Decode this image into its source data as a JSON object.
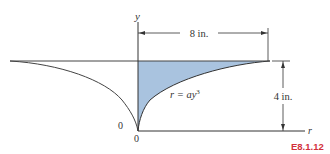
{
  "figure": {
    "id": "E8.1.12",
    "id_color": "#d2303a",
    "fill_color": "#a9c3df",
    "line_color": "#333333"
  },
  "axes": {
    "y_label": "y",
    "r_label": "r",
    "origin_y_label": "0",
    "origin_r_label": "0"
  },
  "dimensions": {
    "width": "8 in.",
    "height": "4 in."
  },
  "equation": {
    "lhs": "r = ay",
    "exponent": "3"
  }
}
